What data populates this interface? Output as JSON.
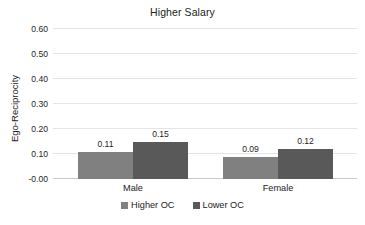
{
  "chart_data": {
    "type": "bar",
    "title": "Higher Salary",
    "xlabel": "",
    "ylabel": "Ego-Reciprocity",
    "categories": [
      "Male",
      "Female"
    ],
    "series": [
      {
        "name": "Higher OC",
        "values": [
          0.11,
          0.09
        ],
        "color": "#808080"
      },
      {
        "name": "Lower OC",
        "values": [
          0.15,
          0.12
        ],
        "color": "#595959"
      }
    ],
    "value_labels": [
      [
        "0.11",
        "0.09"
      ],
      [
        "0.15",
        "0.12"
      ]
    ],
    "ylim": [
      0.0,
      0.6
    ],
    "ytick_values": [
      0.6,
      0.5,
      0.4,
      0.3,
      0.2,
      0.1,
      0.0
    ],
    "ytick_labels": [
      "0.60",
      "0.50",
      "0.40",
      "0.30",
      "0.20",
      "0.10",
      "-0.00"
    ],
    "grid": "horizontal",
    "legend_position": "bottom-center",
    "gridline_color": "#e4e4e4",
    "baseline_color": "#c9c9c9",
    "text_color": "#222222"
  }
}
